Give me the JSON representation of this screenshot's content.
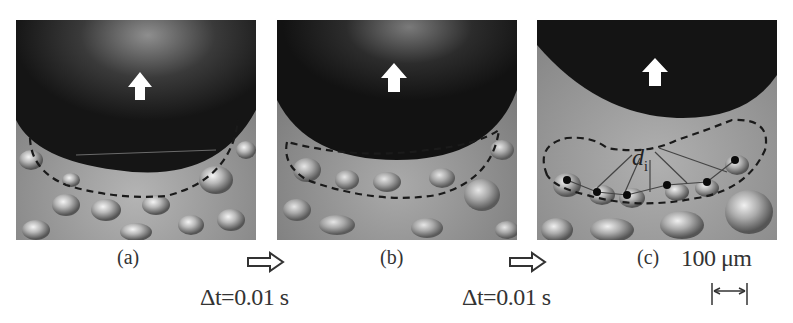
{
  "figure": {
    "panels": [
      {
        "id": "a",
        "label": "(a)"
      },
      {
        "id": "b",
        "label": "(b)"
      },
      {
        "id": "c",
        "label": "(c)",
        "annotation": "d",
        "annotation_subscript": "i"
      }
    ],
    "transitions": [
      {
        "label": "Δt=0.01 s",
        "icon": "hollow-right-arrow-icon"
      },
      {
        "label": "Δt=0.01 s",
        "icon": "hollow-right-arrow-icon"
      }
    ],
    "scale_bar": {
      "label": "100 μm",
      "icon": "double-headed-arrow-icon"
    },
    "motion_icon": "up-arrow-icon",
    "colors": {
      "bubble": "#161616",
      "liquid": "#9c9c9c",
      "dashed_outline": "#1a1a1a",
      "arrow_fill": "#ffffff"
    }
  }
}
